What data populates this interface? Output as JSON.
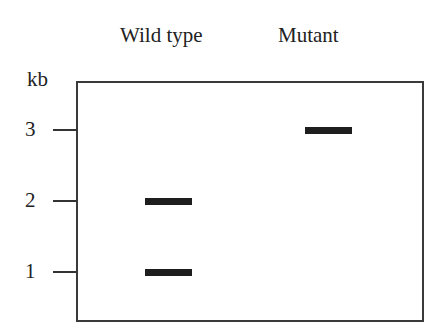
{
  "diagram": {
    "type": "gel_electrophoresis_schematic",
    "lanes": [
      {
        "id": "wild-type",
        "label": "Wild type"
      },
      {
        "id": "mutant",
        "label": "Mutant"
      }
    ],
    "axis": {
      "unit": "kb",
      "ticks": [
        {
          "value": "3",
          "y": 130
        },
        {
          "value": "2",
          "y": 201
        },
        {
          "value": "1",
          "y": 272
        }
      ]
    },
    "bands": [
      {
        "lane": "Wild type",
        "size_kb": 2,
        "x": 145,
        "y": 198,
        "width": 47
      },
      {
        "lane": "Wild type",
        "size_kb": 1,
        "x": 145,
        "y": 269,
        "width": 47
      },
      {
        "lane": "Mutant",
        "size_kb": 3,
        "x": 305,
        "y": 127,
        "width": 47
      }
    ],
    "colors": {
      "background": "#ffffff",
      "line": "#333333",
      "band": "#1e1e1e"
    }
  }
}
